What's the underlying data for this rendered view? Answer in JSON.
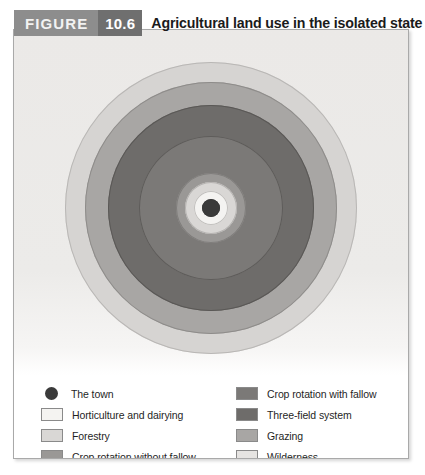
{
  "header": {
    "figure_label": "FIGURE",
    "figure_number": "10.6",
    "title": "Agricultural land use in the isolated state",
    "label_bg": "#8d8d8d",
    "number_bg": "#6f6f6f",
    "title_color": "#1b1b1b"
  },
  "panel": {
    "background": "#ffffff",
    "border_color": "#a9a9a9",
    "chart_background": "#ebe9e7"
  },
  "diagram": {
    "type": "concentric-rings",
    "center_label": "The town",
    "rings": [
      {
        "name": "wilderness",
        "label": "Wilderness",
        "color": "#d6d4d2",
        "outer_radius": 146,
        "stroke": "#b9b7b5"
      },
      {
        "name": "grazing",
        "label": "Grazing",
        "color": "#a8a6a4",
        "outer_radius": 126,
        "stroke": "#8e8c8a"
      },
      {
        "name": "three-field-system",
        "label": "Three-field system",
        "color": "#6e6c6a",
        "outer_radius": 103,
        "stroke": "#5a5856"
      },
      {
        "name": "crop-rotation-with-fallow",
        "label": "Crop rotation with fallow",
        "color": "#7b7977",
        "outer_radius": 72,
        "stroke": "#5e5c5a"
      },
      {
        "name": "crop-rotation-without-fallow",
        "label": "Crop rotation without fallow",
        "color": "#9a9896",
        "outer_radius": 35,
        "stroke": "#7f7d7b"
      },
      {
        "name": "forestry",
        "label": "Forestry",
        "color": "#d9d7d5",
        "outer_radius": 26,
        "stroke": "#b5b3b1"
      },
      {
        "name": "horticulture-and-dairying",
        "label": "Horticulture and dairying",
        "color": "#f4f3f1",
        "outer_radius": 17,
        "stroke": "#c2c0be"
      },
      {
        "name": "the-town",
        "label": "The town",
        "color": "#3a3a3a",
        "outer_radius": 9,
        "stroke": "#3a3a3a"
      }
    ]
  },
  "legend": {
    "left_column": [
      {
        "name": "the-town",
        "label": "The town",
        "color": "#3a3a3a",
        "shape": "dot"
      },
      {
        "name": "horticulture-and-dairying",
        "label": "Horticulture and dairying",
        "color": "#f4f3f1",
        "shape": "rect"
      },
      {
        "name": "forestry",
        "label": "Forestry",
        "color": "#d9d7d5",
        "shape": "rect"
      },
      {
        "name": "crop-rotation-without-fallow",
        "label": "Crop rotation without fallow",
        "color": "#9a9896",
        "shape": "rect"
      }
    ],
    "right_column": [
      {
        "name": "crop-rotation-with-fallow",
        "label": "Crop rotation with fallow",
        "color": "#7b7977",
        "shape": "rect"
      },
      {
        "name": "three-field-system",
        "label": "Three-field system",
        "color": "#6e6c6a",
        "shape": "rect"
      },
      {
        "name": "grazing",
        "label": "Grazing",
        "color": "#a8a6a4",
        "shape": "rect"
      },
      {
        "name": "wilderness",
        "label": "Wilderness",
        "color": "#e6e4e2",
        "shape": "rect"
      }
    ]
  }
}
